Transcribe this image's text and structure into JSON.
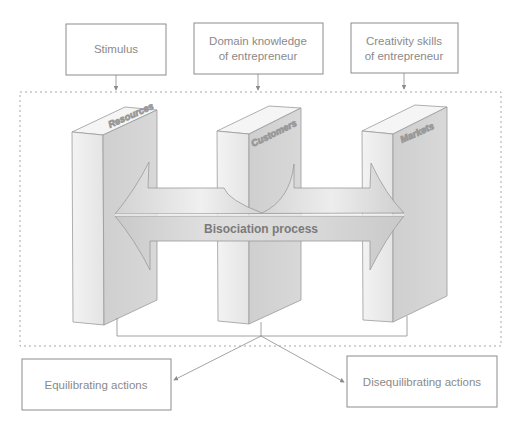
{
  "diagram": {
    "inputs": [
      {
        "id": "stimulus",
        "lines": [
          "Stimulus"
        ]
      },
      {
        "id": "domain-knowledge",
        "lines": [
          "Domain knowledge",
          "of entrepreneur"
        ]
      },
      {
        "id": "creativity-skills",
        "lines": [
          "Creativity skills",
          "of entrepreneur"
        ]
      }
    ],
    "pillars": [
      {
        "id": "resources",
        "label": "Resources"
      },
      {
        "id": "customers",
        "label": "Customers"
      },
      {
        "id": "markets",
        "label": "Markets"
      }
    ],
    "process_label": "Bisociation process",
    "outputs": [
      {
        "id": "equilibrating",
        "label": "Equilibrating actions"
      },
      {
        "id": "disequilibrating",
        "label": "Disequilibrating actions"
      }
    ],
    "colors": {
      "stroke": "#8c8c8c",
      "pillar_front": "#ececec",
      "pillar_side": "#d2d2d2",
      "pillar_top": "#f4f4f4",
      "arrow_fill": "#d0d0d0",
      "text": "#8a8a8a"
    }
  }
}
